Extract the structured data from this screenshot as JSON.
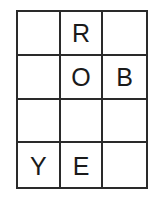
{
  "puzzle": {
    "rows": 4,
    "cols": 3,
    "cells": [
      [
        "",
        "R",
        ""
      ],
      [
        "",
        "O",
        "B"
      ],
      [
        "",
        "",
        ""
      ],
      [
        "Y",
        "E",
        ""
      ]
    ]
  },
  "colors": {
    "line": "#2a2a2a",
    "text": "#1a1a1a",
    "background": "#ffffff"
  }
}
